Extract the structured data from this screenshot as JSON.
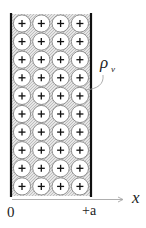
{
  "diagram": {
    "slab": {
      "rows": 10,
      "columns": 4,
      "charge_symbol": "+",
      "fill_color": "#d9d9d9",
      "wall_color": "#111111"
    },
    "labels": {
      "charge_density_symbol": "ρ",
      "charge_density_subscript": "v",
      "axis_label": "x",
      "origin_label": "0",
      "right_bound_label": "+a"
    },
    "colors": {
      "axis_line": "#9a9a9a",
      "leader_line": "#9a9a9a",
      "circle_stroke": "#777777",
      "circle_fill": "#ffffff"
    }
  }
}
